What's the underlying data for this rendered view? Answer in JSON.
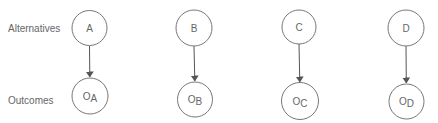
{
  "diagram": {
    "row_labels": {
      "top": "Alternatives",
      "bottom": "Outcomes"
    },
    "alternatives": [
      {
        "label": "A",
        "outcome_main": "O",
        "outcome_sub": "A",
        "cx": 89.5,
        "cy": 28,
        "ocx": 90,
        "ocy": 96
      },
      {
        "label": "B",
        "outcome_main": "O",
        "outcome_sub": "B",
        "cx": 194,
        "cy": 28,
        "ocx": 195,
        "ocy": 99.5
      },
      {
        "label": "C",
        "outcome_main": "O",
        "outcome_sub": "C",
        "cx": 299,
        "cy": 27,
        "ocx": 300,
        "ocy": 101
      },
      {
        "label": "D",
        "outcome_main": "O",
        "outcome_sub": "D",
        "cx": 406,
        "cy": 28,
        "ocx": 406.5,
        "ocy": 101.5
      }
    ],
    "edges": [
      {
        "from": "A",
        "to": "OA"
      },
      {
        "from": "B",
        "to": "OB"
      },
      {
        "from": "C",
        "to": "OC"
      },
      {
        "from": "D",
        "to": "OD"
      }
    ],
    "colors": {
      "stroke": "#777777",
      "text": "#666666",
      "edge": "#555555"
    }
  }
}
